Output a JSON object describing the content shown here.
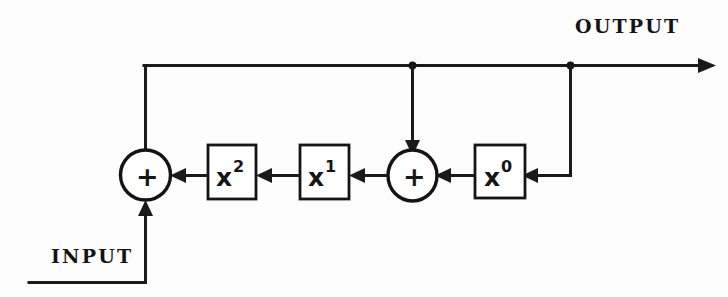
{
  "diagram": {
    "type": "signal-flow-block-diagram",
    "title_visible": false,
    "background_color": "#fdfdfd",
    "line_color": "#1a1a1a",
    "ports": {
      "input_label": "INPUT",
      "output_label": "OUTPUT"
    },
    "blocks": [
      {
        "id": "block-x2",
        "base": "x",
        "exponent": "2",
        "label": "x2"
      },
      {
        "id": "block-x1",
        "base": "x",
        "exponent": "1",
        "label": "x1"
      },
      {
        "id": "block-x0",
        "base": "x",
        "exponent": "0",
        "label": "x0"
      }
    ],
    "adders": [
      {
        "id": "adder-left",
        "symbol": "+"
      },
      {
        "id": "adder-right",
        "symbol": "+"
      }
    ],
    "junctions": [
      {
        "id": "junction-mid-feedback",
        "note": "tap on output bus feeding right adder"
      },
      {
        "id": "junction-right-feedback",
        "note": "tap on output bus feeding x0 block"
      }
    ]
  }
}
